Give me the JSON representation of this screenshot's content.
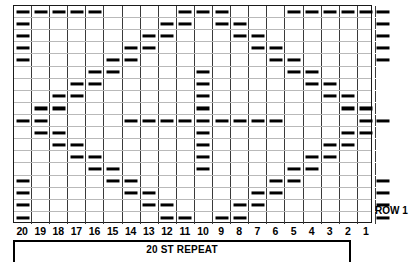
{
  "chart_data": {
    "type": "heatmap",
    "title": "20 ST REPEAT",
    "xlabel": "",
    "ylabel": "",
    "grid": true,
    "legend_position": "none",
    "rows": 18,
    "columns": 21,
    "column_labels": [
      "20",
      "19",
      "18",
      "17",
      "16",
      "15",
      "14",
      "13",
      "12",
      "11",
      "10",
      "9",
      "8",
      "7",
      "6",
      "5",
      "4",
      "3",
      "2",
      "1",
      ""
    ],
    "row_labels": [
      "ROW 1"
    ],
    "symbol": "dash",
    "symbol_meaning": "purl-stitch-dash",
    "note": "Knitting stitch chart. Rows are numbered from the bottom up; ROW 1 is the bottom row. Columns are numbered right-to-left from 1 to 20. Each marked cell contains a horizontal dash symbol.",
    "marked_cells": [
      {
        "row": 18,
        "columns": [
          20,
          19,
          18,
          17,
          16,
          11,
          10,
          9,
          4,
          3,
          2,
          1,
          0
        ]
      },
      {
        "row": 17,
        "columns": [
          20,
          12,
          11,
          9,
          8,
          0
        ]
      },
      {
        "row": 16,
        "columns": [
          20,
          13,
          12,
          8,
          7,
          0
        ]
      },
      {
        "row": 15,
        "columns": [
          20,
          14,
          13,
          7,
          6,
          0
        ]
      },
      {
        "row": 14,
        "columns": [
          20,
          15,
          14,
          6,
          5,
          0
        ]
      },
      {
        "row": 13,
        "columns": [
          16,
          15,
          10,
          5,
          4
        ]
      },
      {
        "row": 12,
        "columns": [
          17,
          16,
          10,
          4,
          3
        ]
      },
      {
        "row": 11,
        "columns": [
          18,
          17,
          10,
          3,
          2
        ]
      },
      {
        "row": 10,
        "columns": [
          19,
          18,
          10,
          2,
          1
        ]
      },
      {
        "row": 9,
        "columns": [
          20,
          19,
          14,
          13,
          12,
          11,
          10,
          9,
          8,
          7,
          6,
          1,
          0
        ]
      },
      {
        "row": 8,
        "columns": [
          19,
          18,
          10,
          2,
          1
        ]
      },
      {
        "row": 7,
        "columns": [
          18,
          17,
          10,
          3,
          2
        ]
      },
      {
        "row": 6,
        "columns": [
          17,
          16,
          10,
          4,
          3
        ]
      },
      {
        "row": 5,
        "columns": [
          16,
          15,
          10,
          5,
          4
        ]
      },
      {
        "row": 4,
        "columns": [
          20,
          15,
          14,
          6,
          5,
          0
        ]
      },
      {
        "row": 3,
        "columns": [
          20,
          14,
          13,
          7,
          6,
          0
        ]
      },
      {
        "row": 2,
        "columns": [
          20,
          13,
          12,
          8,
          7,
          0
        ]
      },
      {
        "row": 1,
        "columns": [
          20,
          12,
          11,
          9,
          8,
          0
        ]
      }
    ]
  },
  "chart": {
    "rows": 18,
    "cols": 21,
    "cell_matrix": [
      [
        1,
        1,
        1,
        1,
        1,
        0,
        0,
        0,
        0,
        1,
        1,
        1,
        0,
        0,
        0,
        1,
        1,
        1,
        1,
        1,
        1
      ],
      [
        1,
        0,
        0,
        0,
        0,
        0,
        0,
        0,
        1,
        1,
        0,
        1,
        1,
        0,
        0,
        0,
        0,
        0,
        0,
        0,
        1
      ],
      [
        1,
        0,
        0,
        0,
        0,
        0,
        0,
        1,
        1,
        0,
        0,
        0,
        1,
        1,
        0,
        0,
        0,
        0,
        0,
        0,
        1
      ],
      [
        1,
        0,
        0,
        0,
        0,
        0,
        1,
        1,
        0,
        0,
        0,
        0,
        0,
        1,
        1,
        0,
        0,
        0,
        0,
        0,
        1
      ],
      [
        1,
        0,
        0,
        0,
        0,
        1,
        1,
        0,
        0,
        0,
        0,
        0,
        0,
        0,
        1,
        1,
        0,
        0,
        0,
        0,
        1
      ],
      [
        0,
        0,
        0,
        0,
        1,
        1,
        0,
        0,
        0,
        0,
        1,
        0,
        0,
        0,
        0,
        1,
        1,
        0,
        0,
        0,
        0
      ],
      [
        0,
        0,
        0,
        1,
        1,
        0,
        0,
        0,
        0,
        0,
        1,
        0,
        0,
        0,
        0,
        0,
        1,
        1,
        0,
        0,
        0
      ],
      [
        0,
        0,
        1,
        1,
        0,
        0,
        0,
        0,
        0,
        0,
        1,
        0,
        0,
        0,
        0,
        0,
        0,
        1,
        1,
        0,
        0
      ],
      [
        0,
        1,
        1,
        0,
        0,
        0,
        0,
        0,
        0,
        0,
        1,
        0,
        0,
        0,
        0,
        0,
        0,
        0,
        1,
        1,
        0
      ],
      [
        1,
        1,
        0,
        0,
        0,
        0,
        1,
        1,
        1,
        1,
        1,
        1,
        1,
        1,
        1,
        0,
        0,
        0,
        0,
        1,
        1
      ],
      [
        0,
        1,
        1,
        0,
        0,
        0,
        0,
        0,
        0,
        0,
        1,
        0,
        0,
        0,
        0,
        0,
        0,
        0,
        1,
        1,
        0
      ],
      [
        0,
        0,
        1,
        1,
        0,
        0,
        0,
        0,
        0,
        0,
        1,
        0,
        0,
        0,
        0,
        0,
        0,
        1,
        1,
        0,
        0
      ],
      [
        0,
        0,
        0,
        1,
        1,
        0,
        0,
        0,
        0,
        0,
        1,
        0,
        0,
        0,
        0,
        0,
        1,
        1,
        0,
        0,
        0
      ],
      [
        0,
        0,
        0,
        0,
        1,
        1,
        0,
        0,
        0,
        0,
        1,
        0,
        0,
        0,
        0,
        1,
        1,
        0,
        0,
        0,
        0
      ],
      [
        1,
        0,
        0,
        0,
        0,
        1,
        1,
        0,
        0,
        0,
        0,
        0,
        0,
        0,
        1,
        1,
        0,
        0,
        0,
        0,
        1
      ],
      [
        1,
        0,
        0,
        0,
        0,
        0,
        1,
        1,
        0,
        0,
        0,
        0,
        0,
        1,
        1,
        0,
        0,
        0,
        0,
        0,
        1
      ],
      [
        1,
        0,
        0,
        0,
        0,
        0,
        0,
        1,
        1,
        0,
        0,
        0,
        1,
        1,
        0,
        0,
        0,
        0,
        0,
        0,
        1
      ],
      [
        1,
        0,
        0,
        0,
        0,
        0,
        0,
        0,
        1,
        1,
        0,
        1,
        1,
        0,
        0,
        0,
        0,
        0,
        0,
        0,
        1
      ]
    ]
  },
  "labels": {
    "column_numbers": [
      "20",
      "19",
      "18",
      "17",
      "16",
      "15",
      "14",
      "13",
      "12",
      "11",
      "10",
      "9",
      "8",
      "7",
      "6",
      "5",
      "4",
      "3",
      "2",
      "1"
    ],
    "repeat_text": "20 ST REPEAT",
    "row_one_text": "ROW 1"
  },
  "colors": {
    "stitch_symbol": "#000000",
    "grid_major": "#3a3a3a",
    "grid_minor": "#b9b9b9",
    "border": "#1a1a1a",
    "background": "#ffffff"
  }
}
